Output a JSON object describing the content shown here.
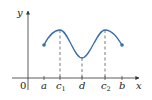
{
  "diagram": {
    "type": "function-graph",
    "axes": {
      "x_label": "x",
      "y_label": "y",
      "origin_label": "0"
    },
    "tick_labels": [
      {
        "id": "a",
        "text": "a",
        "sub": ""
      },
      {
        "id": "c1",
        "text": "c",
        "sub": "1"
      },
      {
        "id": "d",
        "text": "d",
        "sub": ""
      },
      {
        "id": "c2",
        "text": "c",
        "sub": "2"
      },
      {
        "id": "b",
        "text": "b",
        "sub": ""
      }
    ],
    "key_points": {
      "left_endpoint": "a",
      "local_max_1": "c1",
      "local_min": "d",
      "local_max_2": "c2",
      "right_endpoint": "b"
    },
    "colors": {
      "curve": "#3a6ea5",
      "axes": "#333333",
      "dashed": "#444444"
    }
  }
}
